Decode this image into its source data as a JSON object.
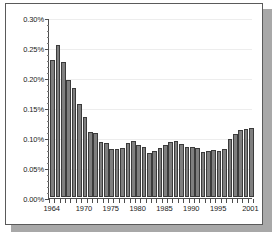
{
  "chart_data": {
    "type": "bar",
    "title": "",
    "subtitle": "",
    "xlabel": "",
    "ylabel": "",
    "ylim": [
      0,
      0.3
    ],
    "ytick_values": [
      0.0,
      0.05,
      0.1,
      0.15,
      0.2,
      0.25,
      0.3
    ],
    "ytick_labels": [
      "0.00%",
      "0.05%",
      "0.10%",
      "0.15%",
      "0.20%",
      "0.25%",
      "0.30%"
    ],
    "xtick_labels": [
      "1964",
      "1970",
      "1975",
      "1980",
      "1985",
      "1990",
      "1995",
      "2001"
    ],
    "xtick_categories": [
      "1964",
      "1970",
      "1975",
      "1980",
      "1985",
      "1990",
      "1995",
      "2001"
    ],
    "grid": true,
    "grid_axis": "y",
    "legend": false,
    "legend_position": "none",
    "value_unit": "percent",
    "bar_color": "#7f7f7f",
    "bar_edge_color": "#3b3b3b",
    "axis_color": "#4d4d4d",
    "gridline_color": "#ededed",
    "plot_background": "#ffffff",
    "card_background": "#ffffff",
    "card_border_color": "#5a5a5a",
    "shadow_color": "#a8a8a8",
    "categories": [
      "1964",
      "1965",
      "1966",
      "1967",
      "1968",
      "1969",
      "1970",
      "1971",
      "1972",
      "1973",
      "1974",
      "1975",
      "1976",
      "1977",
      "1978",
      "1979",
      "1980",
      "1981",
      "1982",
      "1983",
      "1984",
      "1985",
      "1986",
      "1987",
      "1988",
      "1989",
      "1990",
      "1991",
      "1992",
      "1993",
      "1994",
      "1995",
      "1996",
      "1997",
      "1998",
      "1999",
      "2000",
      "2001"
    ],
    "values": [
      0.228,
      0.254,
      0.225,
      0.195,
      0.182,
      0.155,
      0.134,
      0.109,
      0.106,
      0.092,
      0.09,
      0.08,
      0.08,
      0.082,
      0.09,
      0.094,
      0.087,
      0.083,
      0.073,
      0.077,
      0.082,
      0.086,
      0.092,
      0.094,
      0.088,
      0.084,
      0.084,
      0.081,
      0.075,
      0.076,
      0.078,
      0.077,
      0.08,
      0.097,
      0.105,
      0.111,
      0.113,
      0.115
    ]
  }
}
